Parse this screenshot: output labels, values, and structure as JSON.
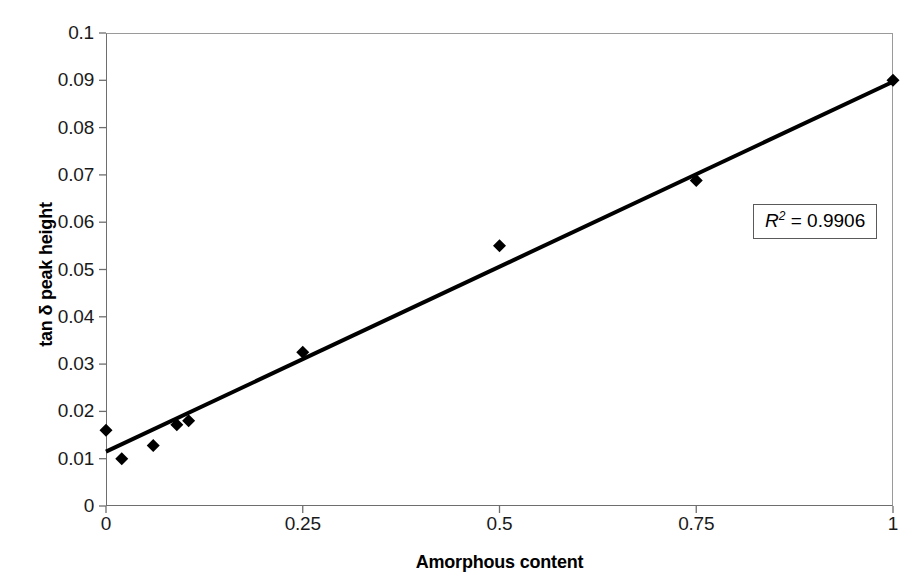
{
  "chart_data": {
    "type": "scatter",
    "title": "",
    "xlabel": "Amorphous content",
    "ylabel": "tan δ peak height",
    "xlim": [
      0,
      1
    ],
    "ylim": [
      0,
      0.1
    ],
    "grid": false,
    "legend": null,
    "x_ticks": [
      "0",
      "0.25",
      "0.5",
      "0.75",
      "1"
    ],
    "x_tick_values": [
      0,
      0.25,
      0.5,
      0.75,
      1
    ],
    "y_ticks": [
      "0",
      "0.01",
      "0.02",
      "0.03",
      "0.04",
      "0.05",
      "0.06",
      "0.07",
      "0.08",
      "0.09",
      "0.1"
    ],
    "y_tick_values": [
      0,
      0.01,
      0.02,
      0.03,
      0.04,
      0.05,
      0.06,
      0.07,
      0.08,
      0.09,
      0.1
    ],
    "series": [
      {
        "name": "tan delta peak height",
        "marker": "diamond",
        "color": "#000000",
        "x": [
          0.0,
          0.02,
          0.06,
          0.09,
          0.105,
          0.25,
          0.5,
          0.75,
          1.0
        ],
        "y": [
          0.016,
          0.01,
          0.0128,
          0.0172,
          0.018,
          0.0325,
          0.055,
          0.0688,
          0.09
        ]
      }
    ],
    "trendline": {
      "type": "linear",
      "x": [
        0.0,
        1.0
      ],
      "y": [
        0.0115,
        0.0897
      ],
      "color": "#000000",
      "width": 4
    },
    "annotations": [
      {
        "name": "r-squared",
        "text": "R2 = 0.9906",
        "symbol": "R",
        "superscript": "2",
        "equals": " = ",
        "value": "0.9906",
        "boxed": true
      }
    ]
  },
  "axes": {
    "x_title": "Amorphous content",
    "y_title": "tan δ peak height"
  },
  "annotation": {
    "r2_symbol": "R",
    "r2_exponent": "2",
    "r2_equals": "=",
    "r2_value": "0.9906"
  }
}
